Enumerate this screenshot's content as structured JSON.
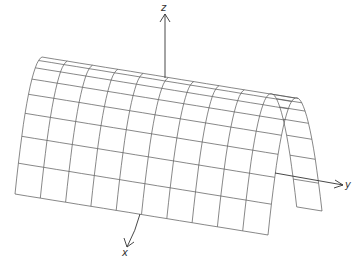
{
  "figure": {
    "surface": "z = -x^2 (parabolic cylinder extended along y)",
    "grid": {
      "lines_along_y": 10,
      "lines_along_x": 8
    },
    "colors": {
      "mesh": "#444444",
      "axes": "#333333",
      "background": "#ffffff"
    }
  },
  "axes": {
    "x": {
      "label": "x"
    },
    "y": {
      "label": "y"
    },
    "z": {
      "label": "z"
    }
  }
}
